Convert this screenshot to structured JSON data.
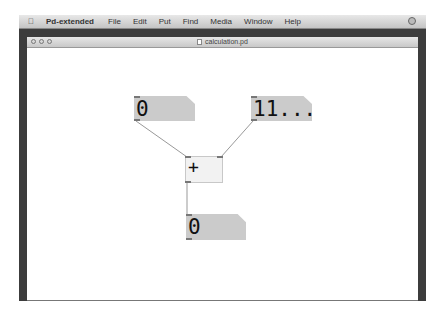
{
  "menubar": {
    "apple_icon": "apple-icon",
    "items": [
      "Pd-extended",
      "File",
      "Edit",
      "Put",
      "Find",
      "Media",
      "Window",
      "Help"
    ],
    "status_icon": "status-icon"
  },
  "window": {
    "title": "calculation.pd",
    "title_icon": "document-icon",
    "buttons": [
      "close",
      "minimize",
      "zoom"
    ]
  },
  "patch": {
    "number_left": "0",
    "number_right": "11...",
    "add_object": "+",
    "number_result": "0"
  },
  "colors": {
    "number_box": "#cbcbcb",
    "object_box": "#f2f2f2",
    "wire": "#999999"
  }
}
